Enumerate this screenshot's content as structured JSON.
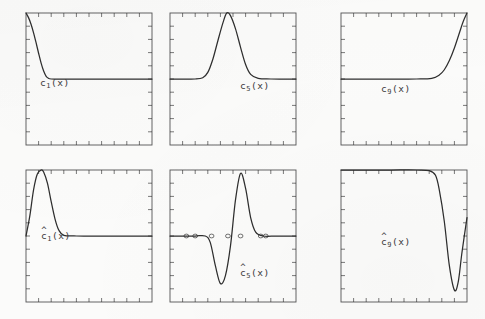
{
  "figure": {
    "kind": "scanned-figure",
    "background_color": "#fbfbfa",
    "ink_color": "#2e2e2e",
    "rows": 2,
    "cols": 3
  },
  "panels": [
    {
      "id": "c1",
      "label_base": "c",
      "label_sub": "1",
      "label_tail": "(x)",
      "hat": false,
      "label_x": 40,
      "label_y": 78,
      "frame": {
        "x": 26,
        "y": 13,
        "w": 126,
        "h": 132
      },
      "ticks": {
        "top": 9,
        "bottom": 9,
        "left": 9,
        "right": 9,
        "len": 4
      },
      "curve_desc": "starts at top-left maximum, decays steeply to zero baseline by ~18% of width, then flat"
    },
    {
      "id": "c5",
      "label_base": "c",
      "label_sub": "5",
      "label_tail": "(x)",
      "hat": false,
      "label_x": 240,
      "label_y": 81,
      "frame": {
        "x": 170,
        "y": 13,
        "w": 126,
        "h": 132
      },
      "ticks": {
        "top": 9,
        "bottom": 9,
        "left": 9,
        "right": 9,
        "len": 4
      },
      "curve_desc": "flat zero baseline, single tall bell-shaped peak centred near 45% of width reaching the top of the frame, returns to zero"
    },
    {
      "id": "c9",
      "label_base": "c",
      "label_sub": "9",
      "label_tail": "(x)",
      "hat": false,
      "label_x": 381,
      "label_y": 84,
      "frame": {
        "x": 341,
        "y": 13,
        "w": 126,
        "h": 132
      },
      "ticks": {
        "top": 9,
        "bottom": 9,
        "left": 9,
        "right": 9,
        "len": 4
      },
      "curve_desc": "flat zero baseline across most of the frame, rises steeply from ~72% of width to the maximum at the right edge"
    },
    {
      "id": "c1hat",
      "label_base": "c",
      "label_sub": "1",
      "label_tail": "(x)",
      "hat": true,
      "label_x": 41,
      "label_y": 231,
      "frame": {
        "x": 26,
        "y": 170,
        "w": 126,
        "h": 132
      },
      "ticks": {
        "top": 9,
        "bottom": 9,
        "left": 9,
        "right": 9,
        "len": 4
      },
      "curve_desc": "rises from zero at left edge to a sharp narrow maximum near 13% of width, decays back to zero baseline by ~30%, flat afterwards"
    },
    {
      "id": "c5hat",
      "label_base": "c",
      "label_sub": "5",
      "label_tail": "(x)",
      "hat": true,
      "label_x": 240,
      "label_y": 268,
      "frame": {
        "x": 170,
        "y": 170,
        "w": 126,
        "h": 132
      },
      "ticks": {
        "top": 9,
        "bottom": 9,
        "left": 9,
        "right": 9,
        "len": 4
      },
      "curve_desc": "flat mid-level baseline, deep negative trough near 40% of width, immediately followed by a tall positive peak near 57%, returns to flat baseline",
      "markers": [
        0.13,
        0.2,
        0.33,
        0.46,
        0.56,
        0.72,
        0.76
      ]
    },
    {
      "id": "c9hat",
      "label_base": "c",
      "label_sub": "9",
      "label_tail": "(x)",
      "hat": true,
      "label_x": 381,
      "label_y": 237,
      "frame": {
        "x": 341,
        "y": 170,
        "w": 126,
        "h": 132
      },
      "ticks": {
        "top": 9,
        "bottom": 9,
        "left": 9,
        "right": 9,
        "len": 4
      },
      "curve_desc": "flat maximum plateau across most of the frame, plunges steeply from ~72% of width to a deep minimum near 90%, rebounds toward the right edge"
    }
  ],
  "chart_data": {
    "type": "line",
    "title": "",
    "xlabel": "",
    "ylabel": "",
    "grid": false,
    "legend": "none",
    "panel_count": 6,
    "axis_ranges": {
      "x": [
        0,
        1
      ],
      "y": [
        -1,
        1
      ]
    },
    "series": [
      {
        "name": "c1(x)",
        "panel": "c1",
        "x": [
          0.0,
          0.02,
          0.04,
          0.06,
          0.08,
          0.1,
          0.12,
          0.14,
          0.16,
          0.18,
          0.2,
          0.3,
          0.5,
          0.7,
          1.0
        ],
        "values": [
          1.0,
          0.93,
          0.83,
          0.7,
          0.55,
          0.39,
          0.24,
          0.12,
          0.04,
          0.01,
          0.0,
          0.0,
          0.0,
          0.0,
          0.0
        ]
      },
      {
        "name": "c5(x)",
        "panel": "c5",
        "x": [
          0.0,
          0.1,
          0.2,
          0.26,
          0.3,
          0.34,
          0.38,
          0.42,
          0.45,
          0.48,
          0.52,
          0.56,
          0.6,
          0.64,
          0.7,
          0.8,
          1.0
        ],
        "values": [
          0.0,
          0.0,
          0.0,
          0.02,
          0.1,
          0.3,
          0.58,
          0.85,
          1.0,
          0.96,
          0.76,
          0.48,
          0.22,
          0.07,
          0.01,
          0.0,
          0.0
        ]
      },
      {
        "name": "c9(x)",
        "panel": "c9",
        "x": [
          0.0,
          0.2,
          0.4,
          0.6,
          0.72,
          0.78,
          0.82,
          0.86,
          0.9,
          0.94,
          0.97,
          1.0
        ],
        "values": [
          0.0,
          0.0,
          0.0,
          0.0,
          0.01,
          0.06,
          0.14,
          0.28,
          0.47,
          0.7,
          0.87,
          1.0
        ]
      },
      {
        "name": "c1hat(x)",
        "panel": "c1hat",
        "x": [
          0.0,
          0.03,
          0.06,
          0.09,
          0.12,
          0.14,
          0.17,
          0.2,
          0.23,
          0.26,
          0.3,
          0.4,
          0.6,
          1.0
        ],
        "values": [
          0.0,
          0.3,
          0.7,
          0.94,
          1.0,
          0.97,
          0.8,
          0.52,
          0.26,
          0.09,
          0.01,
          0.0,
          0.0,
          0.0
        ]
      },
      {
        "name": "c5hat(x)",
        "panel": "c5hat",
        "x": [
          0.0,
          0.1,
          0.2,
          0.28,
          0.32,
          0.36,
          0.4,
          0.44,
          0.48,
          0.52,
          0.56,
          0.6,
          0.64,
          0.68,
          0.74,
          0.85,
          1.0
        ],
        "values": [
          0.0,
          0.0,
          0.0,
          0.0,
          -0.1,
          -0.45,
          -0.72,
          -0.6,
          -0.15,
          0.55,
          0.95,
          0.72,
          0.28,
          0.06,
          0.0,
          0.0,
          0.0
        ]
      },
      {
        "name": "c9hat(x)",
        "panel": "c9hat",
        "x": [
          0.0,
          0.2,
          0.4,
          0.6,
          0.7,
          0.75,
          0.78,
          0.82,
          0.86,
          0.9,
          0.93,
          0.96,
          1.0
        ],
        "values": [
          1.0,
          1.0,
          1.0,
          1.0,
          0.99,
          0.92,
          0.7,
          0.22,
          -0.45,
          -0.82,
          -0.7,
          -0.25,
          0.28
        ]
      }
    ]
  }
}
